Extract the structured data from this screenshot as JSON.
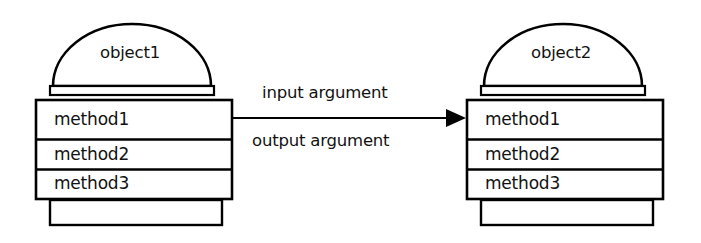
{
  "diagram": {
    "background_color": "#ffffff",
    "stroke_color": "#000000",
    "text_color": "#111111"
  },
  "objects": [
    {
      "id": "object1",
      "title": "object1",
      "methods": [
        {
          "label": "method1"
        },
        {
          "label": "method2"
        },
        {
          "label": "method3"
        }
      ]
    },
    {
      "id": "object2",
      "title": "object2",
      "methods": [
        {
          "label": "method1"
        },
        {
          "label": "method2"
        },
        {
          "label": "method3"
        }
      ]
    }
  ],
  "connector": {
    "direction": "left-to-right",
    "arrowhead": "solid-triangle",
    "labels": {
      "above": "input argument",
      "below": "output argument"
    }
  }
}
